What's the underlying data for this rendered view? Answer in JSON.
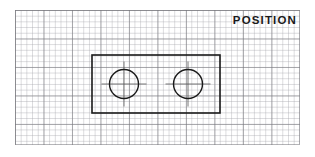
{
  "canvas": {
    "width": 315,
    "height": 157,
    "background_color": "#ffffff"
  },
  "label": {
    "title": "POSITION"
  },
  "grid": {
    "name": "graph-paper",
    "origin_x": 15,
    "origin_y": 10,
    "width": 285,
    "height": 135,
    "minor_cell_px": 5.7,
    "major_cell_px": 28.5,
    "minor_color": "#a5a5ac",
    "major_color": "#78787d"
  },
  "drawing": {
    "line_color": "#1a1a1a",
    "plate": {
      "name": "rectangular-plate",
      "x": 92,
      "y": 55,
      "width": 128,
      "height": 58,
      "stroke_width": 1.6
    },
    "holes": [
      {
        "name": "left-hole",
        "cx": 124,
        "cy": 84,
        "r": 14.5,
        "stroke_width": 1.4
      },
      {
        "name": "right-hole",
        "cx": 188,
        "cy": 84,
        "r": 14.5,
        "stroke_width": 1.4
      }
    ],
    "centerlines": {
      "name": "hole-centerlines",
      "color": "#555555",
      "stroke_width": 0.8,
      "overshoot": 8
    }
  }
}
